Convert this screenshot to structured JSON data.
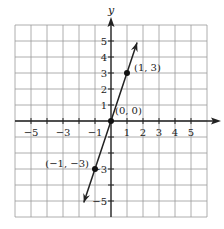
{
  "chart_data": {
    "type": "line",
    "title": "",
    "xlabel": "x",
    "ylabel": "y",
    "xlim": [
      -6,
      6
    ],
    "ylim": [
      -6,
      6
    ],
    "grid": true,
    "x_tick_labels": [
      "−5",
      "−3",
      "−1",
      "1",
      "2",
      "3",
      "4",
      "5"
    ],
    "x_tick_values": [
      -5,
      -3,
      -1,
      1,
      2,
      3,
      4,
      5
    ],
    "y_tick_labels": [
      "5",
      "4",
      "3",
      "2",
      "1",
      "−3",
      "−5"
    ],
    "y_tick_values": [
      5,
      4,
      3,
      2,
      1,
      -3,
      -5
    ],
    "series": [
      {
        "name": "y = 3x",
        "equation": "y = 3x",
        "x": [
          -1.7,
          1.63
        ],
        "y": [
          -5.1,
          4.9
        ],
        "arrows": "both"
      }
    ],
    "points": [
      {
        "x": 1,
        "y": 3,
        "label": "(1, 3)"
      },
      {
        "x": 0,
        "y": 0,
        "label": "(0, 0)"
      },
      {
        "x": -1,
        "y": -3,
        "label": "(−1, −3)"
      }
    ]
  },
  "colors": {
    "grid": "#9a9a9a",
    "axis": "#222222",
    "line": "#222222",
    "point": "#111111",
    "background": "#ffffff"
  }
}
